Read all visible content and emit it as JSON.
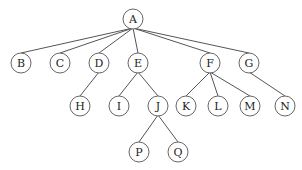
{
  "diagram": {
    "type": "tree",
    "root": "A",
    "nodes": [
      {
        "id": "A",
        "label": "A",
        "x": 133,
        "y": 19
      },
      {
        "id": "B",
        "label": "B",
        "x": 21,
        "y": 63
      },
      {
        "id": "C",
        "label": "C",
        "x": 60,
        "y": 63
      },
      {
        "id": "D",
        "label": "D",
        "x": 99,
        "y": 63
      },
      {
        "id": "E",
        "label": "E",
        "x": 138,
        "y": 63
      },
      {
        "id": "F",
        "label": "F",
        "x": 210,
        "y": 63
      },
      {
        "id": "G",
        "label": "G",
        "x": 249,
        "y": 63
      },
      {
        "id": "H",
        "label": "H",
        "x": 80,
        "y": 106
      },
      {
        "id": "I",
        "label": "I",
        "x": 119,
        "y": 106
      },
      {
        "id": "J",
        "label": "J",
        "x": 158,
        "y": 106
      },
      {
        "id": "K",
        "label": "K",
        "x": 186,
        "y": 106
      },
      {
        "id": "L",
        "label": "L",
        "x": 218,
        "y": 106
      },
      {
        "id": "M",
        "label": "M",
        "x": 250,
        "y": 106
      },
      {
        "id": "N",
        "label": "N",
        "x": 285,
        "y": 106
      },
      {
        "id": "P",
        "label": "P",
        "x": 139,
        "y": 152
      },
      {
        "id": "Q",
        "label": "Q",
        "x": 178,
        "y": 152
      }
    ],
    "edges": [
      [
        "A",
        "B"
      ],
      [
        "A",
        "C"
      ],
      [
        "A",
        "D"
      ],
      [
        "A",
        "E"
      ],
      [
        "A",
        "F"
      ],
      [
        "A",
        "G"
      ],
      [
        "D",
        "H"
      ],
      [
        "E",
        "I"
      ],
      [
        "E",
        "J"
      ],
      [
        "F",
        "K"
      ],
      [
        "F",
        "L"
      ],
      [
        "F",
        "M"
      ],
      [
        "G",
        "N"
      ],
      [
        "J",
        "P"
      ],
      [
        "J",
        "Q"
      ]
    ],
    "node_radius": 10
  }
}
